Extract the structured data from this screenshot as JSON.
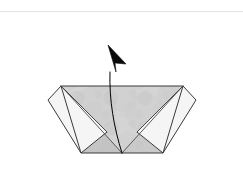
{
  "page": {
    "width": 243,
    "height": 180,
    "background_color": "#ffffff"
  },
  "rule": {
    "name": "top-divider",
    "y": 11,
    "color": "#e3e3e3"
  },
  "colors": {
    "paper_light": "#f2f2f2",
    "paper_mid": "#cdcdcd",
    "paper_shade": "#c6c6c6",
    "paper_highlight": "#e0e0e0",
    "outline": "#3a3a3a",
    "fold_line": "#4a4a4a",
    "arrow": "#000000",
    "texture": "#bdbdbd"
  },
  "figure": {
    "name": "folded-paper-model",
    "base_trapezoid": {
      "name": "base-trapezoid",
      "points": "61,86 183,86 163,153 81,153",
      "fill": "#cdcdcd"
    },
    "left_inner_triangle": {
      "name": "left-inner-triangle",
      "points": "61,86 122,153 81,153",
      "fill": "#c2c2c2"
    },
    "right_inner_triangle": {
      "name": "right-inner-triangle",
      "points": "183,86 163,153 122,153",
      "fill": "#c9c9c9"
    },
    "center_triangle": {
      "name": "center-fold-triangle",
      "points": "61,86 183,86 122,153",
      "fill": "#d2d2d2"
    },
    "left_flap": {
      "name": "left-flap",
      "points": "61,86 48,100 81,153 107,132",
      "fill": "#f4f4f4"
    },
    "right_flap": {
      "name": "right-flap",
      "points": "183,86 196,100 163,153 137,132",
      "fill": "#f4f4f4"
    },
    "fold_lines": [
      {
        "name": "fold-line-left-diagonal",
        "x1": 61,
        "y1": 86,
        "x2": 122,
        "y2": 153
      },
      {
        "name": "fold-line-right-diagonal",
        "x1": 183,
        "y1": 86,
        "x2": 122,
        "y2": 153
      },
      {
        "name": "fold-line-left-flap-edge",
        "x1": 61,
        "y1": 86,
        "x2": 107,
        "y2": 132
      },
      {
        "name": "fold-line-right-flap-edge",
        "x1": 183,
        "y1": 86,
        "x2": 137,
        "y2": 132
      },
      {
        "name": "fold-line-bottom",
        "x1": 81,
        "y1": 153,
        "x2": 163,
        "y2": 153
      },
      {
        "name": "fold-line-top",
        "x1": 61,
        "y1": 86,
        "x2": 183,
        "y2": 86
      }
    ]
  },
  "arrow": {
    "name": "fold-direction-arrow",
    "description": "Curved arrow rising from bottom apex and pointing up-left",
    "path": "M122,153 C114,128 109,100 110,72",
    "tip": {
      "x": 108,
      "y": 45
    },
    "head_points": "108,45 126,64 115,63 116,72",
    "color": "#000000",
    "stroke_width": 1
  }
}
